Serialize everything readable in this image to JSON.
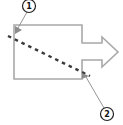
{
  "diagram": {
    "colors": {
      "shape_stroke": "#a8a8a8",
      "dash_line": "#3a3a3a",
      "leader": "#8a8a8a",
      "callout_stroke": "#222222",
      "marker": "#8c8c8c"
    },
    "callouts": [
      {
        "label": "1"
      },
      {
        "label": "2"
      }
    ]
  }
}
